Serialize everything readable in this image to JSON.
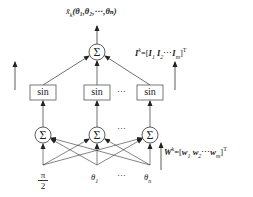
{
  "diagram": {
    "type": "neural-network",
    "output_label": {
      "base": "x̄",
      "sub": "k",
      "args": "(θ₁,θ₂,⋯,θₙ)"
    },
    "output_node": {
      "symbol": "Σ"
    },
    "hidden_layer": {
      "activation_label": "sin",
      "nodes": [
        "sin",
        "sin",
        "sin"
      ],
      "ellipsis": "⋯"
    },
    "sum_layer": {
      "nodes": [
        "Σ",
        "Σ",
        "Σ"
      ],
      "ellipsis": "⋯"
    },
    "inputs": {
      "items": [
        {
          "label": "π/2",
          "num": "π",
          "den": "2"
        },
        {
          "label": "θ₁",
          "base": "θ",
          "sub": "1"
        },
        {
          "label": "θₙ",
          "base": "θ",
          "sub": "n"
        }
      ],
      "ellipsis": "⋯"
    },
    "weights_out": {
      "name": "I",
      "sup": "k",
      "eq": "=[",
      "terms": [
        {
          "base": "I",
          "sub": "1",
          "sup": "k"
        },
        {
          "base": "I",
          "sub": "2",
          "sup": "k"
        },
        {
          "base": "I",
          "sub": "m",
          "sup": "k"
        }
      ],
      "ellipsis": "⋯",
      "close": "]",
      "transpose": "T"
    },
    "weights_in": {
      "name": "W",
      "sup": "k",
      "eq": "=[",
      "terms": [
        {
          "base": "w",
          "sub": "1",
          "sup": "k"
        },
        {
          "base": "w",
          "sub": "2",
          "sup": "k"
        },
        {
          "base": "w",
          "sub": "m",
          "sup": "k"
        }
      ],
      "ellipsis": "⋯",
      "close": "]",
      "transpose": "T"
    }
  }
}
